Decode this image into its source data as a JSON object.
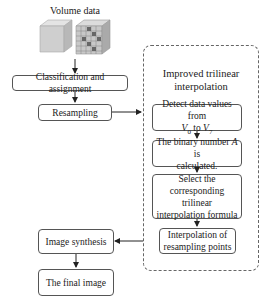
{
  "diagram": {
    "input": {
      "label": "Volume data"
    },
    "steps": {
      "classification": "Classification and assignment",
      "resampling": "Resampling",
      "image_synthesis": "Image synthesis",
      "final_image": "The final image"
    },
    "subprocess": {
      "title_line1": "Improved trilinear",
      "title_line2": "interpolation",
      "detect": {
        "prefix": "Detect data values from",
        "v_start": "V",
        "v_start_sub": "0",
        "to": "to",
        "v_end": "V",
        "v_end_sub": "7"
      },
      "binary": {
        "prefix": "The binary number",
        "var": "A",
        "suffix": "is",
        "line2": "calculated."
      },
      "select": {
        "line1": "Select the",
        "line2": "corresponding trilinear",
        "line3": "interpolation formula"
      },
      "interpolation": {
        "line1": "Interpolation of",
        "line2": "resampling points"
      }
    }
  }
}
